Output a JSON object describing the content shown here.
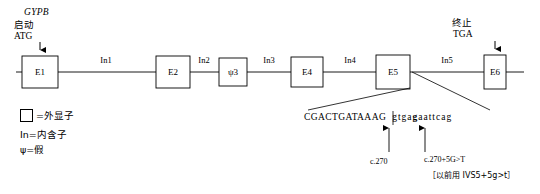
{
  "figure": {
    "gene_label": "GYPB",
    "start_label": "启动",
    "start_codon": "ATG",
    "stop_label": "终止",
    "stop_codon": "TGA"
  },
  "exons": [
    {
      "id": "e1",
      "label": "E1"
    },
    {
      "id": "e2",
      "label": "E2"
    },
    {
      "id": "psi3",
      "label": "ψ3"
    },
    {
      "id": "e4",
      "label": "E4"
    },
    {
      "id": "e5",
      "label": "E5"
    },
    {
      "id": "e6",
      "label": "E6"
    }
  ],
  "introns": [
    {
      "id": "in1",
      "label": "In1"
    },
    {
      "id": "in2",
      "label": "In2"
    },
    {
      "id": "in3",
      "label": "In3"
    },
    {
      "id": "in4",
      "label": "In4"
    },
    {
      "id": "in5",
      "label": "In5"
    }
  ],
  "legend": {
    "exon_text": "=外显子",
    "intron_text": "In=内含子",
    "pseudo_text": "ψ=假"
  },
  "sequence": {
    "exon_part": "CGACTGATAAAG",
    "intron_part_a": "gtga",
    "intron_part_bold": "g",
    "intron_part_b": "aattcag"
  },
  "annotations": {
    "left": "c.270",
    "right": "c.270+5G>T",
    "right_note": "［以前用 IVS5+5g>t］"
  },
  "colors": {
    "stroke": "#000000",
    "box_fill": "#ffffff",
    "background": "#ffffff"
  }
}
